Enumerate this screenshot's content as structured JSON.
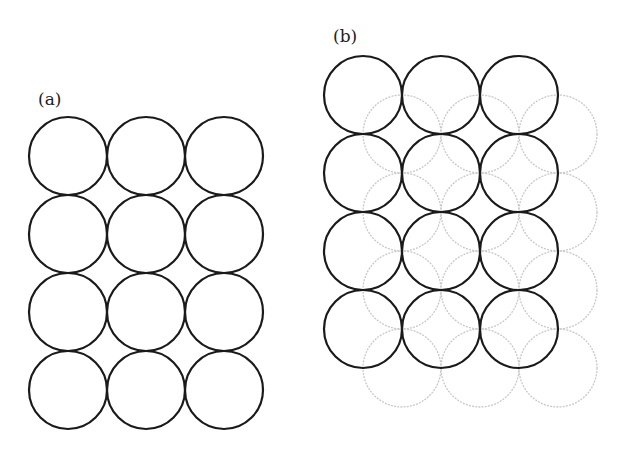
{
  "figure": {
    "panels": [
      {
        "label": "(a)",
        "label_pos": [
          38,
          105
        ],
        "layers": [
          {
            "style": "dark",
            "color": "#1a1a1a",
            "radius": 39,
            "origin": [
              68,
              156
            ],
            "pitch": 78,
            "cols": 3,
            "rows": 4
          }
        ]
      },
      {
        "label": "(b)",
        "label_pos": [
          333,
          42
        ],
        "layers": [
          {
            "style": "light",
            "color": "#c8c8c8",
            "radius": 39,
            "origin": [
              402,
              134
            ],
            "pitch": 78,
            "cols": 3,
            "rows": 4
          },
          {
            "style": "dark",
            "color": "#1a1a1a",
            "radius": 39,
            "origin": [
              363,
              95
            ],
            "pitch": 78,
            "cols": 3,
            "rows": 4
          }
        ]
      }
    ]
  }
}
